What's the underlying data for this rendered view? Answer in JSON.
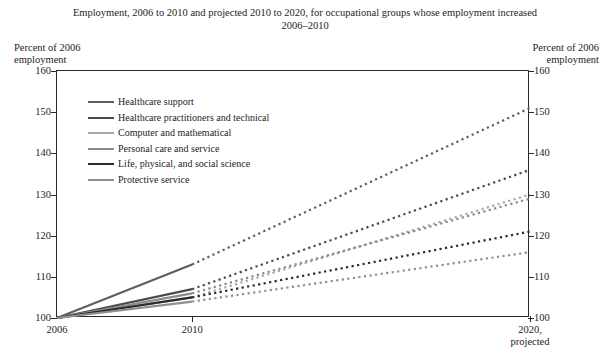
{
  "chart_data": {
    "type": "line",
    "title": "Employment, 2006 to 2010 and projected 2010 to 2020, for occupational groups whose employment increased 2006–2010",
    "xlabel": "",
    "ylabel": "Percent of 2006 employment",
    "ylim": [
      100,
      160
    ],
    "ytick_labels": [
      "100",
      "110",
      "120",
      "130",
      "140",
      "150",
      "160"
    ],
    "ytick_values": [
      100,
      110,
      120,
      130,
      140,
      150,
      160
    ],
    "x": [
      2006,
      2010,
      2020
    ],
    "xtick_labels": [
      "2006",
      "2010",
      "2020,\nprojected"
    ],
    "grid": false,
    "legend_position": "upper-left inside plot",
    "actual_segment_style": "solid",
    "projected_segment_style": "dotted",
    "series": [
      {
        "name": "Healthcare support",
        "values": [
          100,
          113,
          151
        ],
        "color": "#5f5f5f",
        "width": 2.2
      },
      {
        "name": "Healthcare practitioners and technical",
        "values": [
          100,
          107,
          136
        ],
        "color": "#4a4a4a",
        "width": 2.2
      },
      {
        "name": "Computer and mathematical",
        "values": [
          100,
          105,
          130
        ],
        "color": "#a8a8a8",
        "width": 2.2
      },
      {
        "name": "Personal care and service",
        "values": [
          100,
          106,
          129
        ],
        "color": "#8a8a8a",
        "width": 2.2
      },
      {
        "name": "Life, physical, and social science",
        "values": [
          100,
          105,
          121
        ],
        "color": "#2b2b2b",
        "width": 2.2
      },
      {
        "name": "Protective service",
        "values": [
          100,
          104,
          116
        ],
        "color": "#8f8f8f",
        "width": 2.2
      }
    ]
  },
  "header": {
    "title": "Employment, 2006 to 2010 and projected 2010 to 2020, for occupational groups whose employment increased 2006–2010"
  },
  "axes": {
    "left_caption": "Percent of 2006\nemployment",
    "right_caption": "Percent of 2006\nemployment"
  },
  "legend": {
    "items": [
      {
        "label": "Healthcare support"
      },
      {
        "label": "Healthcare practitioners and technical"
      },
      {
        "label": "Computer and mathematical"
      },
      {
        "label": "Personal care and service"
      },
      {
        "label": "Life, physical, and social science"
      },
      {
        "label": "Protective service"
      }
    ]
  }
}
